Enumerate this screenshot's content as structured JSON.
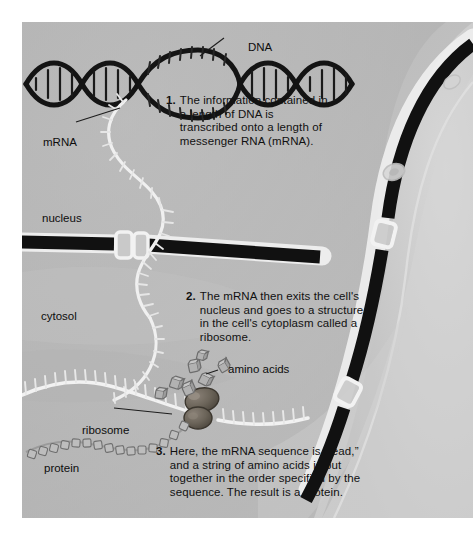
{
  "figure": {
    "background_color": "#b9b9b9",
    "ink_color": "#111111"
  },
  "labels": [
    {
      "id": "dna",
      "text": "DNA",
      "name": "label-dna"
    },
    {
      "id": "mrna",
      "text": "mRNA",
      "name": "label-mrna"
    },
    {
      "id": "nucleus",
      "text": "nucleus",
      "name": "label-nucleus"
    },
    {
      "id": "cytosol",
      "text": "cytosol",
      "name": "label-cytosol"
    },
    {
      "id": "amino",
      "text": "amino acids",
      "name": "label-amino-acids"
    },
    {
      "id": "ribosome",
      "text": "ribosome",
      "name": "label-ribosome"
    },
    {
      "id": "protein",
      "text": "protein",
      "name": "label-protein"
    }
  ],
  "steps": [
    {
      "number": "1.",
      "text": "The information contained in a length of DNA is transcribed onto a length of messenger RNA (mRNA)."
    },
    {
      "number": "2.",
      "text": "The mRNA then exits the cell's nucleus and goes to a structure in the cell's cytoplasm called a ribosome."
    },
    {
      "number": "3.",
      "text": "Here, the mRNA sequence is “read,” and a string of amino acids is put together in the order specified by the sequence. The result is a protein."
    }
  ]
}
